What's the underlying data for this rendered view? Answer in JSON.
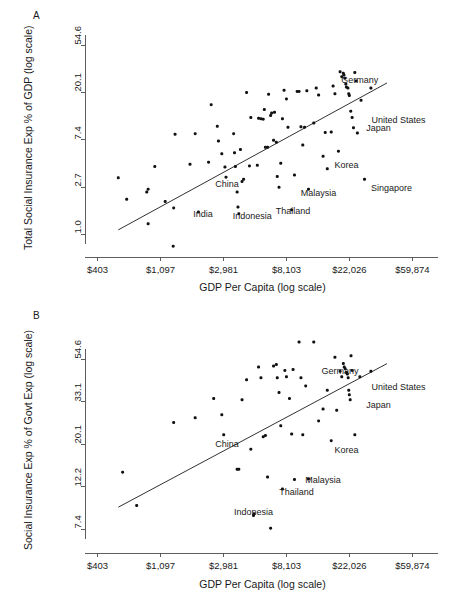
{
  "figure": {
    "panels": [
      {
        "letter": "A",
        "xlabel": "GDP Per Capita (log scale)",
        "ylabel": "Total Social Insurance Exp % of GDP (log scale)"
      },
      {
        "letter": "B",
        "xlabel": "GDP Per Capita (log scale)",
        "ylabel": "Social Insurance Exp % of Govt Exp (log scale)"
      }
    ]
  },
  "chart_data": [
    {
      "type": "scatter",
      "panel": "A",
      "title": "",
      "xlabel": "GDP Per Capita (log scale)",
      "ylabel": "Total Social Insurance Exp % of GDP (log scale)",
      "xscale": "log",
      "yscale": "log",
      "xtick_labels": [
        "$403",
        "$1,097",
        "$2,981",
        "$8,103",
        "$22,026",
        "$59,874"
      ],
      "xtick_values": [
        403,
        1097,
        2981,
        8103,
        22026,
        59874
      ],
      "ytick_labels": [
        "1.0",
        "2.7",
        "7.4",
        "20.1",
        "54.6"
      ],
      "ytick_values": [
        1.0,
        2.7,
        7.4,
        20.1,
        54.6
      ],
      "xlim": [
        330,
        90000
      ],
      "ylim": [
        0.62,
        75.0
      ],
      "grid": false,
      "legend": false,
      "fit_line": {
        "x0": 560,
        "y0": 1.1,
        "x1": 40000,
        "y1": 24.5
      },
      "annotations": [
        {
          "label": "Germany",
          "x": 26000,
          "y": 25.5
        },
        {
          "label": "United States",
          "x": 48000,
          "y": 11.0
        },
        {
          "label": "Japan",
          "x": 35000,
          "y": 9.2
        },
        {
          "label": "Korea",
          "x": 21000,
          "y": 4.2
        },
        {
          "label": "Singapore",
          "x": 43000,
          "y": 2.6
        },
        {
          "label": "Malaysia",
          "x": 13500,
          "y": 2.35
        },
        {
          "label": "Thailand",
          "x": 9000,
          "y": 1.62
        },
        {
          "label": "Indonesia",
          "x": 4700,
          "y": 1.45
        },
        {
          "label": "India",
          "x": 2150,
          "y": 1.5
        },
        {
          "label": "China",
          "x": 3150,
          "y": 2.85
        }
      ],
      "points": [
        {
          "x": 560,
          "y": 3.3
        },
        {
          "x": 640,
          "y": 2.1
        },
        {
          "x": 880,
          "y": 2.45
        },
        {
          "x": 900,
          "y": 2.6
        },
        {
          "x": 1000,
          "y": 4.2
        },
        {
          "x": 900,
          "y": 1.25
        },
        {
          "x": 1180,
          "y": 2.0
        },
        {
          "x": 1350,
          "y": 1.75
        },
        {
          "x": 1380,
          "y": 8.3
        },
        {
          "x": 1340,
          "y": 0.78
        },
        {
          "x": 1900,
          "y": 8.4
        },
        {
          "x": 2000,
          "y": 1.6
        },
        {
          "x": 2450,
          "y": 15.5
        },
        {
          "x": 2700,
          "y": 9.8
        },
        {
          "x": 2750,
          "y": 7.2
        },
        {
          "x": 2900,
          "y": 5.5
        },
        {
          "x": 3050,
          "y": 4.15
        },
        {
          "x": 3100,
          "y": 3.35
        },
        {
          "x": 3500,
          "y": 8.4
        },
        {
          "x": 3550,
          "y": 5.6
        },
        {
          "x": 3600,
          "y": 4.2
        },
        {
          "x": 3700,
          "y": 2.45
        },
        {
          "x": 3750,
          "y": 1.78
        },
        {
          "x": 3800,
          "y": 1.55
        },
        {
          "x": 4000,
          "y": 3.05
        },
        {
          "x": 4100,
          "y": 3.2
        },
        {
          "x": 4300,
          "y": 20.0
        },
        {
          "x": 4600,
          "y": 11.8
        },
        {
          "x": 5200,
          "y": 11.6
        },
        {
          "x": 5400,
          "y": 11.5
        },
        {
          "x": 5600,
          "y": 11.4
        },
        {
          "x": 5700,
          "y": 14.0
        },
        {
          "x": 5800,
          "y": 6.3
        },
        {
          "x": 6000,
          "y": 6.3
        },
        {
          "x": 6100,
          "y": 19.3
        },
        {
          "x": 6300,
          "y": 12.3
        },
        {
          "x": 6400,
          "y": 13.0
        },
        {
          "x": 6600,
          "y": 7.3
        },
        {
          "x": 6900,
          "y": 7.0
        },
        {
          "x": 7000,
          "y": 3.4
        },
        {
          "x": 7200,
          "y": 2.7
        },
        {
          "x": 7400,
          "y": 4.5
        },
        {
          "x": 7600,
          "y": 11.5
        },
        {
          "x": 7800,
          "y": 21.0
        },
        {
          "x": 8100,
          "y": 17.5
        },
        {
          "x": 8300,
          "y": 9.6
        },
        {
          "x": 8800,
          "y": 1.68
        },
        {
          "x": 9200,
          "y": 3.5
        },
        {
          "x": 9600,
          "y": 20.5
        },
        {
          "x": 9900,
          "y": 20.5
        },
        {
          "x": 10200,
          "y": 9.7
        },
        {
          "x": 10500,
          "y": 6.6
        },
        {
          "x": 10800,
          "y": 9.6
        },
        {
          "x": 11200,
          "y": 20.8
        },
        {
          "x": 11500,
          "y": 2.6
        },
        {
          "x": 12500,
          "y": 10.5
        },
        {
          "x": 13000,
          "y": 22.0
        },
        {
          "x": 13500,
          "y": 19.0
        },
        {
          "x": 14500,
          "y": 5.2
        },
        {
          "x": 15000,
          "y": 8.6
        },
        {
          "x": 15500,
          "y": 4.0
        },
        {
          "x": 16500,
          "y": 8.7
        },
        {
          "x": 17000,
          "y": 23.0
        },
        {
          "x": 17500,
          "y": 19.5
        },
        {
          "x": 18500,
          "y": 5.8
        },
        {
          "x": 19000,
          "y": 31.0
        },
        {
          "x": 19500,
          "y": 28.0
        },
        {
          "x": 20000,
          "y": 30.0
        },
        {
          "x": 20200,
          "y": 29.0
        },
        {
          "x": 20500,
          "y": 27.0
        },
        {
          "x": 20800,
          "y": 24.0
        },
        {
          "x": 21000,
          "y": 22.5
        },
        {
          "x": 21500,
          "y": 22.0
        },
        {
          "x": 21800,
          "y": 19.5
        },
        {
          "x": 22000,
          "y": 18.8
        },
        {
          "x": 22500,
          "y": 13.5
        },
        {
          "x": 23000,
          "y": 11.8
        },
        {
          "x": 23500,
          "y": 9.5
        },
        {
          "x": 24000,
          "y": 30.5
        },
        {
          "x": 24500,
          "y": 25.5
        },
        {
          "x": 25000,
          "y": 8.5
        },
        {
          "x": 26500,
          "y": 17.0
        },
        {
          "x": 28000,
          "y": 3.2
        },
        {
          "x": 31000,
          "y": 22.0
        },
        {
          "x": 6700,
          "y": 13.2
        },
        {
          "x": 5100,
          "y": 4.3
        },
        {
          "x": 4500,
          "y": 4.25
        },
        {
          "x": 3900,
          "y": 6.0
        },
        {
          "x": 2350,
          "y": 4.6
        },
        {
          "x": 1750,
          "y": 4.4
        }
      ]
    },
    {
      "type": "scatter",
      "panel": "B",
      "title": "",
      "xlabel": "GDP Per Capita (log scale)",
      "ylabel": "Social Insurance Exp % of Govt Exp (log scale)",
      "xscale": "log",
      "yscale": "log",
      "xtick_labels": [
        "$403",
        "$1,097",
        "$2,981",
        "$8,103",
        "$22,026",
        "$59,874"
      ],
      "xtick_values": [
        403,
        1097,
        2981,
        8103,
        22026,
        59874
      ],
      "ytick_labels": [
        "7.4",
        "12.2",
        "20.1",
        "33.1",
        "54.6"
      ],
      "ytick_values": [
        7.4,
        12.2,
        20.1,
        33.1,
        54.6
      ],
      "xlim": [
        330,
        90000
      ],
      "ylim": [
        5.6,
        80.0
      ],
      "grid": false,
      "legend": false,
      "fit_line": {
        "x0": 560,
        "y0": 9.6,
        "x1": 40000,
        "y1": 52.0
      },
      "annotations": [
        {
          "label": "Germany",
          "x": 19000,
          "y": 47.0
        },
        {
          "label": "United States",
          "x": 48000,
          "y": 39.0
        },
        {
          "label": "Japan",
          "x": 35000,
          "y": 31.5
        },
        {
          "label": "Korea",
          "x": 21000,
          "y": 18.5
        },
        {
          "label": "Malaysia",
          "x": 14500,
          "y": 13.0
        },
        {
          "label": "Thailand",
          "x": 9500,
          "y": 11.3
        },
        {
          "label": "Indonesia",
          "x": 4800,
          "y": 9.0
        },
        {
          "label": "China",
          "x": 3150,
          "y": 20.0
        }
      ],
      "points": [
        {
          "x": 600,
          "y": 14.5
        },
        {
          "x": 750,
          "y": 9.8
        },
        {
          "x": 1350,
          "y": 26.0
        },
        {
          "x": 1900,
          "y": 27.5
        },
        {
          "x": 2550,
          "y": 34.5
        },
        {
          "x": 2900,
          "y": 28.5
        },
        {
          "x": 2990,
          "y": 22.5
        },
        {
          "x": 3700,
          "y": 15.0
        },
        {
          "x": 3800,
          "y": 15.0
        },
        {
          "x": 4000,
          "y": 34.0
        },
        {
          "x": 4300,
          "y": 43.0
        },
        {
          "x": 4600,
          "y": 19.0
        },
        {
          "x": 4800,
          "y": 8.7
        },
        {
          "x": 4850,
          "y": 8.9
        },
        {
          "x": 5200,
          "y": 50.0
        },
        {
          "x": 5400,
          "y": 44.0
        },
        {
          "x": 5600,
          "y": 22.0
        },
        {
          "x": 5800,
          "y": 22.3
        },
        {
          "x": 6000,
          "y": 13.7
        },
        {
          "x": 6300,
          "y": 7.5
        },
        {
          "x": 6600,
          "y": 50.5
        },
        {
          "x": 6900,
          "y": 51.5
        },
        {
          "x": 7000,
          "y": 44.0
        },
        {
          "x": 7200,
          "y": 37.0
        },
        {
          "x": 7400,
          "y": 25.0
        },
        {
          "x": 7600,
          "y": 11.9
        },
        {
          "x": 7900,
          "y": 48.0
        },
        {
          "x": 8100,
          "y": 44.5
        },
        {
          "x": 8500,
          "y": 34.5
        },
        {
          "x": 8800,
          "y": 22.7
        },
        {
          "x": 9200,
          "y": 13.3
        },
        {
          "x": 9900,
          "y": 67.0
        },
        {
          "x": 10500,
          "y": 22.5
        },
        {
          "x": 11000,
          "y": 40.0
        },
        {
          "x": 11500,
          "y": 13.4
        },
        {
          "x": 12500,
          "y": 67.0
        },
        {
          "x": 13500,
          "y": 26.5
        },
        {
          "x": 14500,
          "y": 30.5
        },
        {
          "x": 15500,
          "y": 38.0
        },
        {
          "x": 16500,
          "y": 21.0
        },
        {
          "x": 17500,
          "y": 56.0
        },
        {
          "x": 18000,
          "y": 30.0
        },
        {
          "x": 19000,
          "y": 47.5
        },
        {
          "x": 19500,
          "y": 44.5
        },
        {
          "x": 20000,
          "y": 52.0
        },
        {
          "x": 20300,
          "y": 50.0
        },
        {
          "x": 20600,
          "y": 49.0
        },
        {
          "x": 21000,
          "y": 47.0
        },
        {
          "x": 21300,
          "y": 46.0
        },
        {
          "x": 21600,
          "y": 44.0
        },
        {
          "x": 21800,
          "y": 38.0
        },
        {
          "x": 22000,
          "y": 36.0
        },
        {
          "x": 22300,
          "y": 34.0
        },
        {
          "x": 22600,
          "y": 57.0
        },
        {
          "x": 23000,
          "y": 48.0
        },
        {
          "x": 24000,
          "y": 22.5
        },
        {
          "x": 26000,
          "y": 44.5
        },
        {
          "x": 31000,
          "y": 47.5
        },
        {
          "x": 10200,
          "y": 44.0
        },
        {
          "x": 9000,
          "y": 48.5
        }
      ]
    }
  ]
}
